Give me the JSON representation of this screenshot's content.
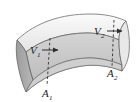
{
  "figure": {
    "type": "flow-tube-diagram",
    "background_color": "#ffffff",
    "labels": [
      {
        "id": "v1",
        "symbol": "V",
        "subscript": "1",
        "text": "V1",
        "meaning": "inlet flow velocity",
        "x": 32,
        "y": 53
      },
      {
        "id": "v2",
        "symbol": "V",
        "subscript": "2",
        "text": "V2",
        "meaning": "outlet flow velocity",
        "x": 96,
        "y": 34
      },
      {
        "id": "a1",
        "symbol": "A",
        "subscript": "1",
        "text": "A1",
        "meaning": "inlet cross-sectional area",
        "x": 45,
        "y": 93
      },
      {
        "id": "a2",
        "symbol": "A",
        "subscript": "2",
        "text": "A2",
        "meaning": "outlet cross-sectional area",
        "x": 110,
        "y": 73
      }
    ],
    "arrows": [
      {
        "id": "v1-arrow",
        "label": "V1",
        "direction": "right",
        "from_x": 42,
        "from_y": 50,
        "to_x": 59,
        "to_y": 50
      },
      {
        "id": "v2-arrow",
        "label": "V2",
        "direction": "right",
        "from_x": 107,
        "from_y": 31,
        "to_x": 123,
        "to_y": 31
      }
    ],
    "section_lines": [
      {
        "id": "a1-section",
        "label": "A1",
        "style": "dashed",
        "x_top": 50,
        "y_top": 40,
        "x_bottom": 47,
        "y_bottom": 86
      },
      {
        "id": "a2-section",
        "label": "A2",
        "style": "dashed",
        "x_top": 114,
        "y_top": 22,
        "x_bottom": 112,
        "y_bottom": 66
      }
    ],
    "colors": {
      "tube_upper_fill": "#f0f0f0",
      "tube_lower_fill": "#c9c9c9",
      "end_cap_fill": "#ababab",
      "outline": "#4a4a4a",
      "dashed_line": "#2e2e2e",
      "arrow": "#2e2e2e",
      "text": "#1c1c1c"
    }
  }
}
